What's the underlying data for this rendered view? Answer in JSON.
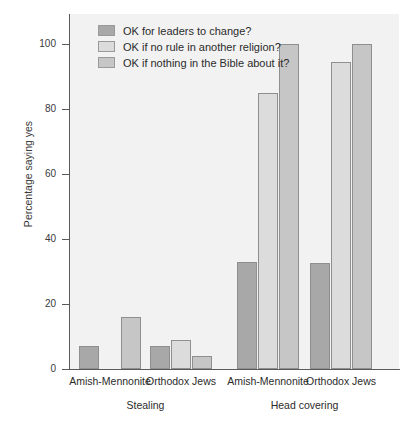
{
  "chart_data": {
    "type": "bar",
    "title": "",
    "xlabel": "",
    "ylabel": "Percentage saying yes",
    "ylim": [
      0,
      100
    ],
    "yticks": [
      0,
      20,
      40,
      60,
      80,
      100
    ],
    "grid": false,
    "legend_position": "top-left-inside",
    "categories": [
      "Amish-Mennonite",
      "Orthodox Jews",
      "Amish-Mennonite",
      "Orthodox Jews"
    ],
    "group_labels": [
      "Stealing",
      "Head covering"
    ],
    "series": [
      {
        "name": "OK for leaders to change?",
        "color": "#a8a8a8",
        "values": [
          7,
          7,
          33,
          32.5
        ]
      },
      {
        "name": "OK if no rule in another religion?",
        "color": "#dcdcdc",
        "values": [
          0,
          9,
          85,
          94.5
        ]
      },
      {
        "name": "OK if nothing in the Bible about it?",
        "color": "#c6c6c6",
        "values": [
          16,
          4,
          100,
          100
        ]
      }
    ]
  },
  "legend": {
    "items": [
      {
        "label": "OK for leaders to change?",
        "color": "#a8a8a8"
      },
      {
        "label": "OK if no rule in another religion?",
        "color": "#dcdcdc"
      },
      {
        "label": "OK if nothing in the Bible about it?",
        "color": "#c6c6c6"
      }
    ]
  },
  "axes": {
    "y_title": "Percentage saying yes",
    "y_ticks": [
      "0",
      "20",
      "40",
      "60",
      "80",
      "100"
    ],
    "x_category_labels": [
      "Amish-Mennonite",
      "Orthodox Jews",
      "Amish-Mennonite",
      "Orthodox Jews"
    ],
    "x_group_labels": [
      "Stealing",
      "Head covering"
    ]
  }
}
